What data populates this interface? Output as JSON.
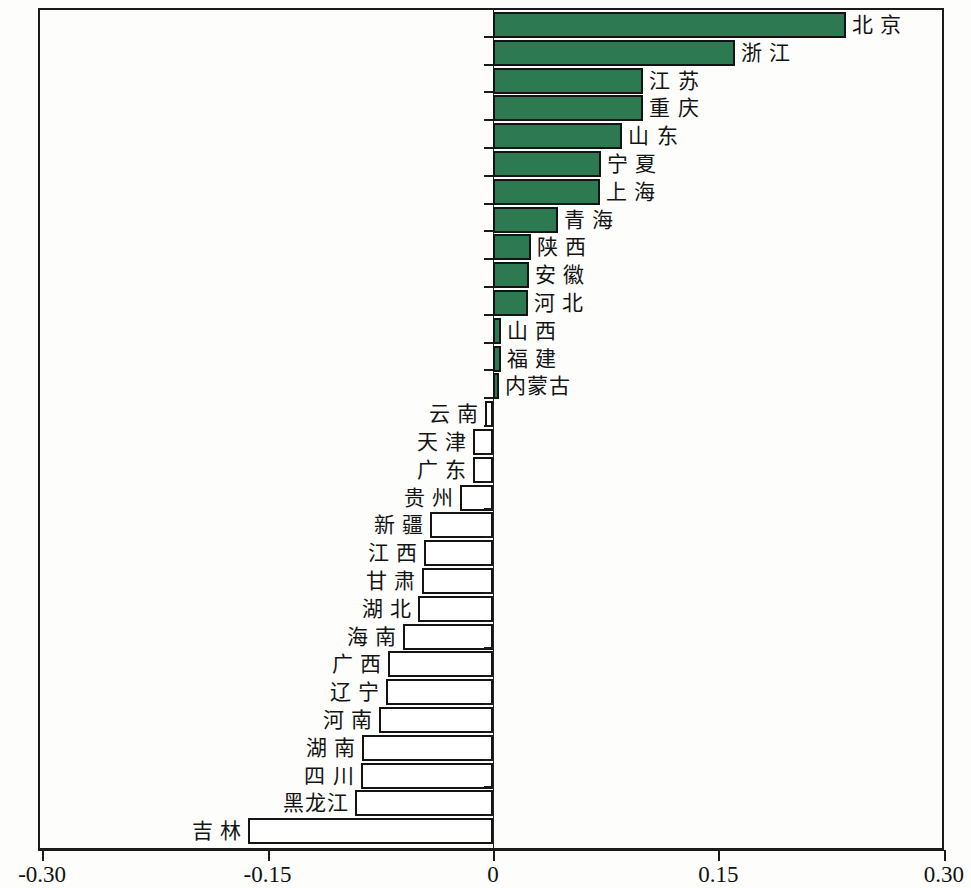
{
  "chart_data": {
    "type": "bar",
    "orientation": "horizontal",
    "title": "",
    "subtitle": "",
    "xlabel": "",
    "ylabel": "",
    "xlim": [
      -0.3,
      0.3
    ],
    "grid": false,
    "legend": "none",
    "xticks": [
      "-0.30",
      "-0.15",
      "0",
      "0.15",
      "0.30"
    ],
    "xtick_values": [
      -0.3,
      -0.15,
      0,
      0.15,
      0.3
    ],
    "colors": {
      "positive_fill": "#2d7a52",
      "negative_fill": "#ffffff",
      "bar_border": "#141414",
      "axis": "#1b1b1b"
    },
    "categories": [
      "北 京",
      "浙 江",
      "江 苏",
      "重 庆",
      "山 东",
      "宁 夏",
      "上 海",
      "青 海",
      "陕 西",
      "安 徽",
      "河 北",
      "山 西",
      "福 建",
      "内蒙古",
      "云 南",
      "天 津",
      "广 东",
      "贵 州",
      "新 疆",
      "江 西",
      "甘 肃",
      "湖 北",
      "海 南",
      "广 西",
      "辽 宁",
      "河 南",
      "湖 南",
      "四 川",
      "黑龙江",
      "吉 林"
    ],
    "values": [
      0.235,
      0.161,
      0.1,
      0.1,
      0.086,
      0.072,
      0.071,
      0.043,
      0.025,
      0.024,
      0.023,
      0.005,
      0.005,
      0.004,
      -0.005,
      -0.013,
      -0.013,
      -0.022,
      -0.042,
      -0.046,
      -0.047,
      -0.05,
      -0.06,
      -0.07,
      -0.071,
      -0.076,
      -0.087,
      -0.088,
      -0.092,
      -0.163
    ]
  }
}
